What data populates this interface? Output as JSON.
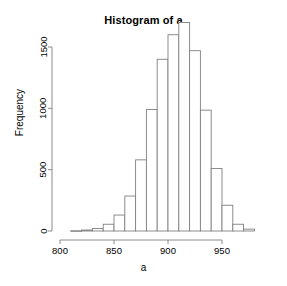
{
  "chart_data": {
    "type": "bar",
    "title": "Histogram of a",
    "xlabel": "a",
    "ylabel": "Frequency",
    "bin_width": 10,
    "bin_starts": [
      800,
      810,
      820,
      830,
      840,
      850,
      860,
      870,
      880,
      890,
      900,
      910,
      920,
      930,
      940,
      950,
      960,
      970
    ],
    "bin_ends": [
      810,
      820,
      830,
      840,
      850,
      860,
      870,
      880,
      890,
      900,
      910,
      920,
      930,
      940,
      950,
      960,
      970,
      980
    ],
    "categories": [
      "800-810",
      "810-820",
      "820-830",
      "830-840",
      "840-850",
      "850-860",
      "860-870",
      "870-880",
      "880-890",
      "890-900",
      "900-910",
      "910-920",
      "920-930",
      "930-940",
      "940-950",
      "950-960",
      "960-970",
      "970-980"
    ],
    "values": [
      0,
      2,
      8,
      20,
      55,
      130,
      285,
      580,
      990,
      1400,
      1600,
      1700,
      1470,
      985,
      510,
      210,
      55,
      15
    ],
    "xlim": [
      800,
      980
    ],
    "ylim": [
      0,
      1750
    ],
    "xticks": [
      800,
      850,
      900,
      950
    ],
    "xtick_labels": [
      "800",
      "850",
      "900",
      "950"
    ],
    "yticks": [
      0,
      500,
      1000,
      1500
    ],
    "ytick_labels": [
      "0",
      "500",
      "1000",
      "1500"
    ],
    "grid": false,
    "legend": null,
    "bar_fill": "#ffffff",
    "bar_stroke": "#808080",
    "axis_color": "#808080",
    "text_color": "#000000",
    "background": "#ffffff"
  },
  "figure": {
    "title": "Histogram of a",
    "x_axis_title": "a",
    "y_axis_title": "Frequency"
  }
}
